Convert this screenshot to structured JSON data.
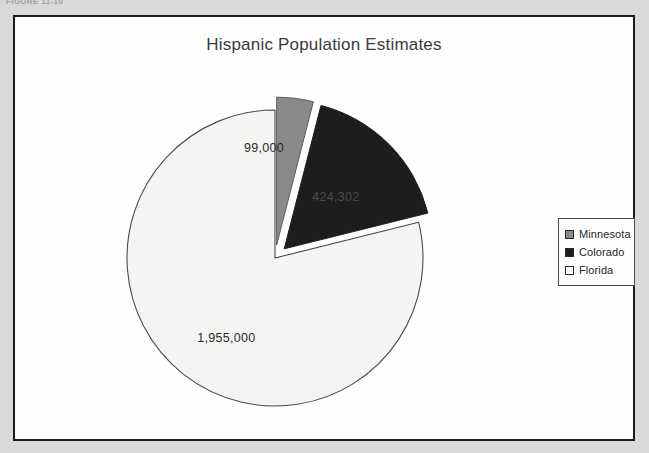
{
  "page": {
    "caption_fragment": "FIGURE 11-10"
  },
  "chart_data": {
    "type": "pie",
    "title": "Hispanic Population Estimates",
    "xlabel": "",
    "ylabel": "",
    "categories": [
      "Minnesota",
      "Colorado",
      "Florida"
    ],
    "values": [
      99000,
      424302,
      1955000
    ],
    "value_labels": [
      "99,000",
      "424,302",
      "1,955,000"
    ],
    "colors": [
      "#8a8a8a",
      "#1d1d1d",
      "#f4f4f2"
    ],
    "legend_position": "right",
    "exploded": [
      "Minnesota",
      "Colorado"
    ],
    "start_angle_deg": 0,
    "grid": false
  },
  "legend": {
    "items": [
      {
        "label": "Minnesota",
        "color": "#8a8a8a"
      },
      {
        "label": "Colorado",
        "color": "#1d1d1d"
      },
      {
        "label": "Florida",
        "color": "#fbfbfa"
      }
    ]
  }
}
